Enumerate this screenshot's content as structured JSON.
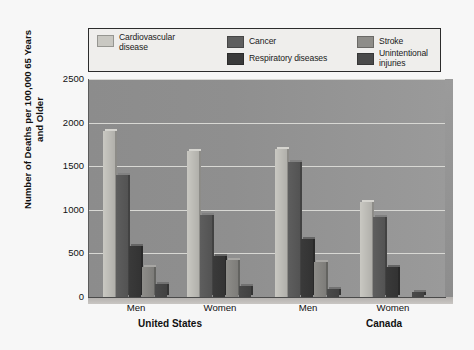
{
  "chart_data": {
    "type": "bar",
    "title": "",
    "subtitle": "",
    "xlabel": "",
    "ylabel": "Number of Deaths per\n100,000 65 Years and Older",
    "ylim": [
      0,
      2500
    ],
    "yticks": [
      0,
      500,
      1000,
      1500,
      2000,
      2500
    ],
    "ytick_labels": [
      "0",
      "500",
      "1000",
      "1500",
      "2000",
      "2500"
    ],
    "grid": true,
    "legend_position": "top",
    "categories": [
      "Men",
      "Women",
      "Men",
      "Women"
    ],
    "supercategories": [
      "United States",
      "Canada"
    ],
    "series": [
      {
        "name": "Cardiovascular disease",
        "color": "#c9c8c2",
        "values": [
          1900,
          1670,
          1700,
          1090
        ]
      },
      {
        "name": "Cancer",
        "color": "#5e5e5e",
        "values": [
          1400,
          940,
          1550,
          920
        ]
      },
      {
        "name": "Respiratory diseases",
        "color": "#3a3a3a",
        "values": [
          590,
          470,
          660,
          340
        ]
      },
      {
        "name": "Stroke",
        "color": "#8e8d89",
        "values": [
          340,
          430,
          400,
          0
        ]
      },
      {
        "name": "Unintentional injuries",
        "color": "#4a4a4a",
        "values": [
          150,
          130,
          90,
          60
        ]
      }
    ]
  },
  "legend": {
    "items": [
      {
        "label": "Cardiovascular\ndisease",
        "swatch": "#c9c8c2"
      },
      {
        "label": "Cancer",
        "swatch": "#5e5e5e"
      },
      {
        "label": "Stroke",
        "swatch": "#8e8d89"
      },
      {
        "label": "Respiratory diseases",
        "swatch": "#3a3a3a"
      },
      {
        "label": "Unintentional injuries",
        "swatch": "#4a4a4a"
      }
    ]
  },
  "axes": {
    "y_title": "Number of Deaths per\n100,000 65 Years and Older",
    "y_tick_2500": "2500",
    "y_tick_2000": "2000",
    "y_tick_1500": "1500",
    "y_tick_1000": "1000",
    "y_tick_500": "500",
    "y_tick_0": "0",
    "x_tick_1": "Men",
    "x_tick_2": "Women",
    "x_tick_3": "Men",
    "x_tick_4": "Women",
    "x_group_1": "United States",
    "x_group_2": "Canada"
  },
  "colors": {
    "plot_bg_left": "#8c8c8c",
    "plot_bg_right": "#9a9a9a",
    "figure_bg": "#f7f7f7",
    "gridline": "#d8d8d4",
    "axis": "#4a4a4a",
    "legend_bg": "#efeeec",
    "legend_border": "#2c2c2c"
  }
}
